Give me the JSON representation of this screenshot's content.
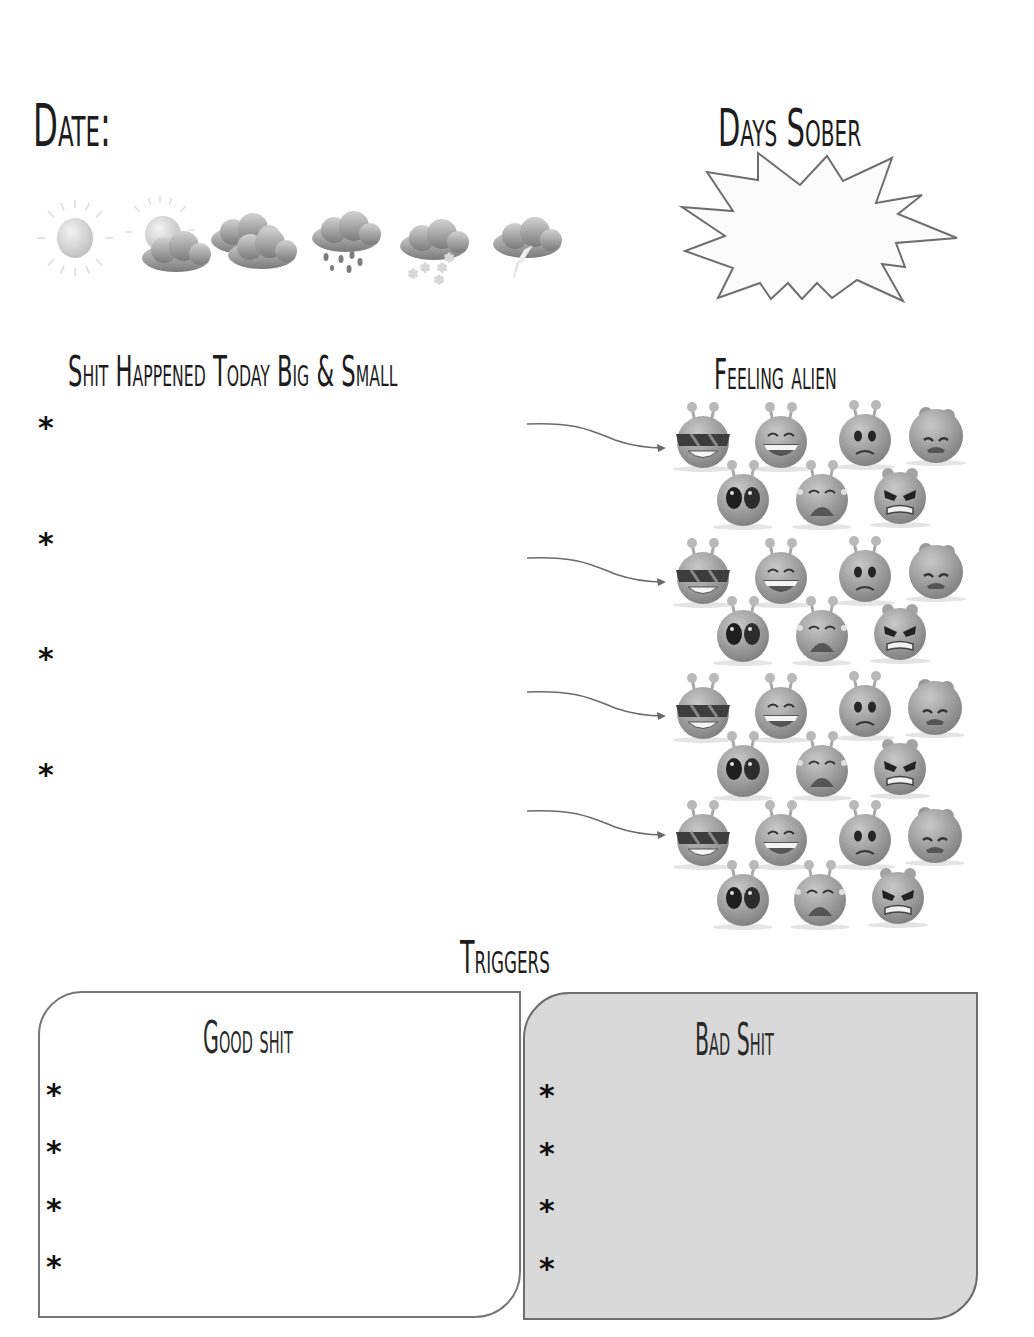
{
  "header": {
    "date_label": "Date:",
    "days_sober_label": "Days Sober"
  },
  "weather": {
    "icons": [
      {
        "name": "sunny-icon"
      },
      {
        "name": "partly-cloudy-icon"
      },
      {
        "name": "cloudy-icon"
      },
      {
        "name": "rain-icon"
      },
      {
        "name": "snow-icon"
      },
      {
        "name": "thunderstorm-icon"
      }
    ]
  },
  "events": {
    "title": "Shit Happened Today Big & Small",
    "bullet": "*",
    "items": [
      {
        "bullet": "*"
      },
      {
        "bullet": "*"
      },
      {
        "bullet": "*"
      },
      {
        "bullet": "*"
      }
    ]
  },
  "feelings": {
    "title": "Feeling alien",
    "faces": [
      "cool",
      "laughing",
      "worried",
      "sad",
      "shocked",
      "crying",
      "angry"
    ]
  },
  "triggers": {
    "title": "Triggers",
    "good": {
      "title": "Good shit",
      "items": [
        {
          "bullet": "*"
        },
        {
          "bullet": "*"
        },
        {
          "bullet": "*"
        },
        {
          "bullet": "*"
        }
      ]
    },
    "bad": {
      "title": "Bad Shit",
      "items": [
        {
          "bullet": "*"
        },
        {
          "bullet": "*"
        },
        {
          "bullet": "*"
        },
        {
          "bullet": "*"
        }
      ]
    }
  },
  "colors": {
    "ink": "#1d1d1d",
    "outline": "#777777",
    "bad_box_fill": "#d9d9d9",
    "alien_gray": "#9a9a9a"
  }
}
